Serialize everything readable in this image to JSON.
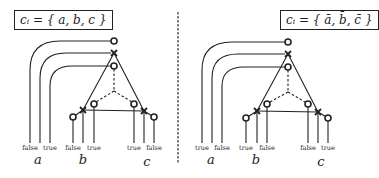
{
  "left_panel": {
    "clause_label": "cᵢ = { a, b, c }",
    "variables": [
      {
        "name": "a",
        "labels": [
          "false",
          "true"
        ]
      },
      {
        "name": "b",
        "labels": [
          "false",
          "true"
        ]
      },
      {
        "name": "c",
        "labels": [
          "true",
          "false"
        ]
      }
    ]
  },
  "right_panel": {
    "clause_label": "cᵢ = { ā, b̄, c̄ }",
    "variables": [
      {
        "name": "a",
        "labels": [
          "true",
          "false"
        ]
      },
      {
        "name": "b",
        "labels": [
          "true",
          "false"
        ]
      },
      {
        "name": "c",
        "labels": [
          "false",
          "true"
        ]
      }
    ]
  },
  "colors": {
    "stroke": "#222222",
    "background": "#ffffff"
  }
}
